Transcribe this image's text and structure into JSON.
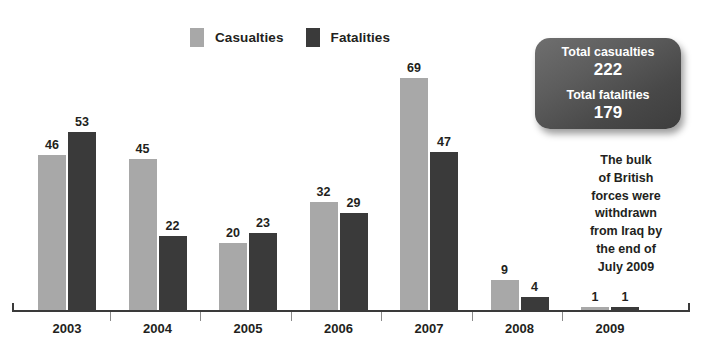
{
  "chart_data": {
    "type": "bar",
    "title": "",
    "subtitle": "",
    "xlabel": "",
    "ylabel": "",
    "categories": [
      "2003",
      "2004",
      "2005",
      "2006",
      "2007",
      "2008",
      "2009"
    ],
    "series": [
      {
        "name": "Casualties",
        "color": "#a8a8a8",
        "values": [
          46,
          45,
          20,
          32,
          69,
          9,
          1
        ]
      },
      {
        "name": "Fatalities",
        "color": "#3a3a3a",
        "values": [
          53,
          22,
          23,
          29,
          47,
          4,
          1
        ]
      }
    ],
    "ylim": [
      0,
      69
    ],
    "grid": false,
    "legend_position": "top-center",
    "data_labels": true,
    "annotations": [
      "The bulk of British forces were withdrawn from Iraq by the end of July 2009"
    ]
  },
  "legend": {
    "items": [
      {
        "label": "Casualties",
        "color": "#a8a8a8"
      },
      {
        "label": "Fatalities",
        "color": "#3a3a3a"
      }
    ]
  },
  "totals_box": {
    "casualties_caption": "Total casualties",
    "casualties_value": "222",
    "fatalities_caption": "Total fatalities",
    "fatalities_value": "179"
  },
  "annotation": {
    "lines": [
      "The bulk",
      "of British",
      "forces were",
      "withdrawn",
      "from Iraq by",
      "the end of",
      "July 2009"
    ]
  },
  "colors": {
    "casualties": "#a8a8a8",
    "fatalities": "#3a3a3a",
    "axis": "#3a3a3a",
    "text": "#231f20",
    "background": "#ffffff"
  }
}
